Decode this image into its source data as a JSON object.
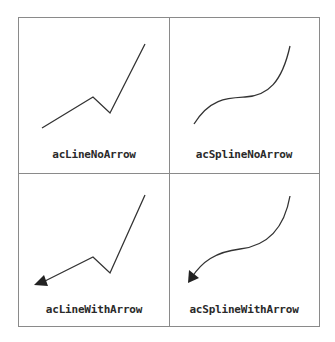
{
  "panels": [
    {
      "label": "acLineNoArrow",
      "type": "line",
      "arrow": false
    },
    {
      "label": "acSplineNoArrow",
      "type": "spline",
      "arrow": false
    },
    {
      "label": "acLineWithArrow",
      "type": "line",
      "arrow": true
    },
    {
      "label": "acSplineWithArrow",
      "type": "spline",
      "arrow": true
    }
  ],
  "colors": {
    "stroke": "#333333",
    "border": "#8a8a8a",
    "text": "#2a2a2a"
  }
}
